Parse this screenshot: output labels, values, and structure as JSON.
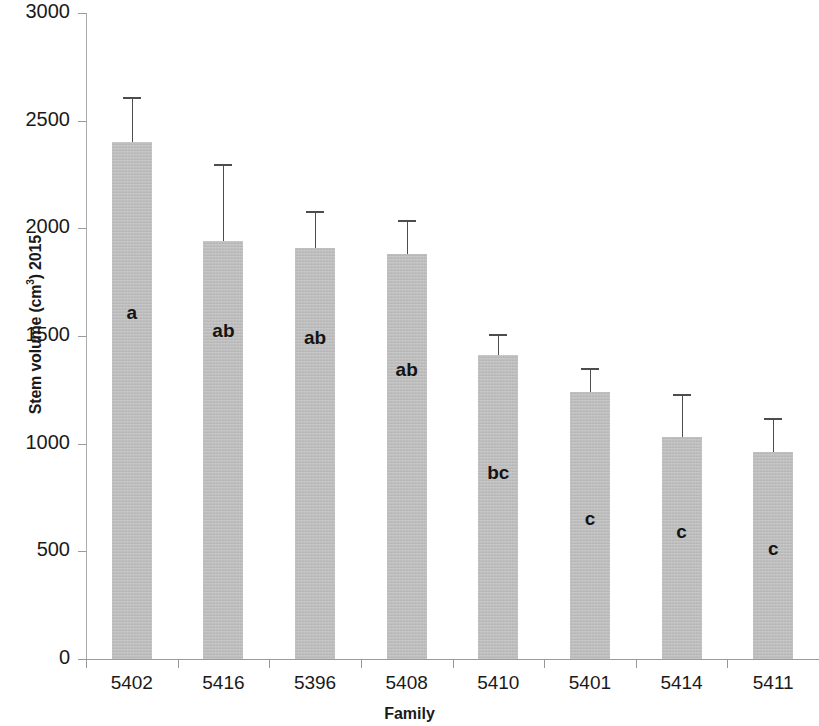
{
  "chart_data": {
    "type": "bar",
    "title": "",
    "xlabel": "Family",
    "ylabel": "Stem volume (cm³) 2015",
    "ylabel_base": "Stem volume (cm",
    "ylabel_sup": "3",
    "ylabel_tail": ") 2015",
    "categories": [
      "5402",
      "5416",
      "5396",
      "5408",
      "5410",
      "5401",
      "5414",
      "5411"
    ],
    "values": [
      2400,
      1940,
      1910,
      1880,
      1410,
      1240,
      1030,
      960
    ],
    "error_upper": [
      2610,
      2300,
      2080,
      2040,
      1510,
      1350,
      1230,
      1120
    ],
    "error_bars": "upper-only",
    "significance_letters": [
      "a",
      "ab",
      "ab",
      "ab",
      "bc",
      "c",
      "c",
      "c"
    ],
    "ylim": [
      0,
      3000
    ],
    "yticks": [
      3000,
      2500,
      2000,
      1500,
      1000,
      500,
      0
    ],
    "ytick_labels": [
      "3000",
      "2500",
      "2000",
      "1500",
      "1000",
      "500",
      "0"
    ],
    "grid": false,
    "legend": null,
    "bar_color": "#b9b9b9",
    "error_color": "#4d4d4d",
    "axis_color": "#9a9a9a",
    "text_color": "#1a1a1a"
  }
}
